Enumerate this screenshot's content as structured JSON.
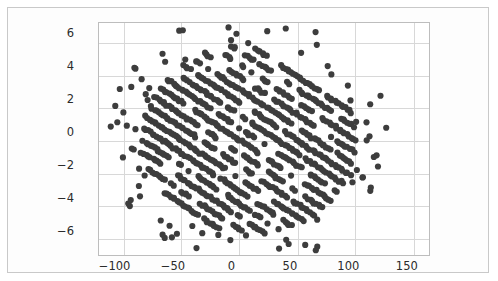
{
  "figure": {
    "background_color": "#fdfdfd",
    "border_color": "#c9c9c9",
    "plot_background_color": "#ffffff",
    "gridline_color": "#d8d8d8",
    "marker_color": "#3d3d3d"
  },
  "chart_data": {
    "type": "scatter",
    "title": "",
    "xlabel": "",
    "ylabel": "",
    "xlim": [
      -121,
      163
    ],
    "ylim": [
      -7.0,
      7.2
    ],
    "xticks": [
      -100,
      -50,
      0,
      50,
      100,
      150
    ],
    "xtick_labels": [
      "-100",
      "-50",
      "0",
      "50",
      "100",
      "150"
    ],
    "yticks": [
      6,
      4,
      2,
      0,
      -2,
      -4,
      -6
    ],
    "ytick_labels": [
      "6",
      "4",
      "2",
      "0",
      "-2",
      "-4",
      "-6"
    ],
    "grid": true,
    "legend": null,
    "marker_size": 3.1,
    "structure": {
      "pattern": "parallel-diagonal-bands",
      "band_count": 17,
      "band_slope_y_per_x": -0.047,
      "band_intercept_start": -6.6,
      "band_intercept_step": 0.78,
      "envelope_center_x": 8,
      "envelope_center_y": 0.1,
      "envelope_radius_x": 92,
      "envelope_radius_y": 5.9,
      "points_per_band": 150,
      "band_x_min": -118,
      "band_x_max": 148,
      "jitter_y": 0.055,
      "jitter_x": 0.9,
      "gap_probability": 0.1
    },
    "outliers": {
      "count": 86,
      "ring_radius_scale_min": 1.0,
      "ring_radius_scale_max": 1.32,
      "description": "Isolated markers scattered just outside the dense elliptical core."
    }
  }
}
